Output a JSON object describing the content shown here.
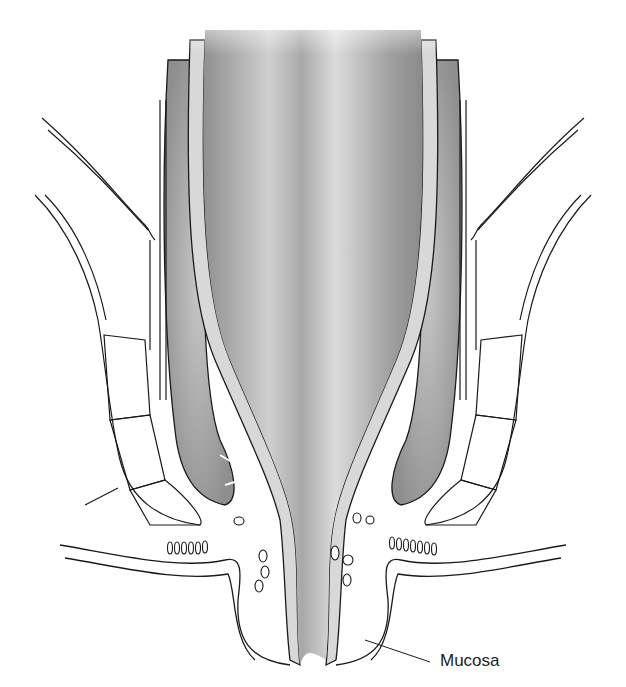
{
  "figure": {
    "labels": [
      {
        "id": "mucosa",
        "text": "Mucosa",
        "x": 440,
        "y": 652,
        "leader": {
          "from": [
            430,
            662
          ],
          "to": [
            365,
            640
          ]
        }
      }
    ],
    "colors": {
      "line": "#1a1a1a",
      "mucosa_fill": "#d8d8d8",
      "lumen_dark": "#8a8a8a",
      "lumen_light": "#d6d6d6",
      "muscle_fill": "#b5b5b5",
      "background": "#ffffff"
    }
  }
}
